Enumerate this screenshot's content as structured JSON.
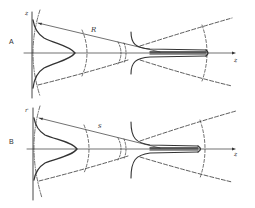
{
  "figure": {
    "panels": [
      {
        "id": "A",
        "label": "A",
        "vertical_axis_label": "z",
        "horizontal_axis_label": "z",
        "radius_label": "R"
      },
      {
        "id": "B",
        "label": "B",
        "vertical_axis_label": "r",
        "horizontal_axis_label": "z",
        "radius_label": "s"
      }
    ],
    "colors": {
      "ink": "#333333",
      "background": "#ffffff"
    }
  }
}
